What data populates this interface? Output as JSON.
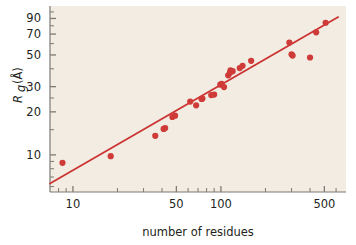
{
  "chart_data": {
    "type": "scatter",
    "title": "",
    "xlabel": "number of residues",
    "ylabel": "Rg (Å)",
    "ylabel_parts": {
      "symbol": "R",
      "subscript": "g",
      "unit": "(Å)"
    },
    "xscale": "log",
    "yscale": "log",
    "xlim": [
      7,
      700
    ],
    "ylim": [
      5.5,
      110
    ],
    "grid": false,
    "legend": null,
    "xticks": [
      10,
      50,
      100,
      500
    ],
    "xtick_labels": [
      "10",
      "50",
      "100",
      "500"
    ],
    "xminor_ticks": [
      8,
      9,
      20,
      30,
      40,
      60,
      70,
      80,
      90,
      200,
      300,
      400,
      600
    ],
    "yticks": [
      10,
      20,
      30,
      50,
      70,
      90
    ],
    "ytick_labels": [
      "10",
      "20",
      "30",
      "50",
      "70",
      "90"
    ],
    "yminor_ticks": [
      6,
      7,
      8,
      9,
      15,
      25,
      40,
      60,
      80,
      100
    ],
    "series": [
      {
        "name": "proteins",
        "marker": "circle",
        "color": "#cf3b38",
        "points": [
          [
            8.5,
            8.8
          ],
          [
            18,
            9.8
          ],
          [
            36,
            13.6
          ],
          [
            41,
            15.2
          ],
          [
            42,
            15.4
          ],
          [
            47,
            18.4
          ],
          [
            49,
            18.8
          ],
          [
            62,
            23.6
          ],
          [
            68,
            22.2
          ],
          [
            74,
            24.6
          ],
          [
            75,
            24.8
          ],
          [
            86,
            26.2
          ],
          [
            90,
            26.4
          ],
          [
            99,
            31.0
          ],
          [
            101,
            31.4
          ],
          [
            105,
            29.8
          ],
          [
            112,
            36.0
          ],
          [
            115,
            37.5
          ],
          [
            116,
            39.0
          ],
          [
            120,
            38.5
          ],
          [
            134,
            40.5
          ],
          [
            140,
            42.0
          ],
          [
            160,
            45.5
          ],
          [
            290,
            61.0
          ],
          [
            300,
            50.5
          ],
          [
            305,
            49.5
          ],
          [
            400,
            48.0
          ],
          [
            440,
            72.0
          ],
          [
            510,
            84.0
          ]
        ]
      }
    ],
    "fit_line": {
      "name": "power-law fit",
      "color": "#cc3333",
      "x_start": 7,
      "y_start": 6.3,
      "x_end": 620,
      "y_end": 92.0,
      "description": "Rg proportional to N^0.4"
    }
  },
  "colors": {
    "plot_background": "#f2ece2",
    "figure_background": "#ffffff",
    "marker": "#cf3b38",
    "line": "#cc3333",
    "axis": "#7d7a73",
    "text": "#231f20"
  }
}
